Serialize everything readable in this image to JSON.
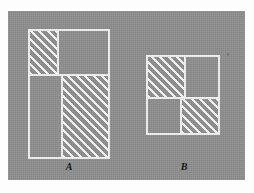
{
  "image": {
    "background_color": "#fdfdfd",
    "panel_color": "#8f8f8f",
    "line_color": "#f2f2f2",
    "hatch_color": "#ffffff",
    "label_color": "#111111"
  },
  "figures": [
    {
      "id": "A",
      "label": "A",
      "shape": "tall-rectangle-subdivided",
      "description": "Tall rectangle divided into four regions; upper-left and lower-right regions are hatched",
      "regions": [
        {
          "name": "upper-left",
          "hatched": true,
          "position": "top-left"
        },
        {
          "name": "upper-right",
          "hatched": false,
          "position": "top-right"
        },
        {
          "name": "lower-left",
          "hatched": false,
          "position": "bottom-left"
        },
        {
          "name": "lower-right",
          "hatched": true,
          "position": "bottom-right"
        }
      ]
    },
    {
      "id": "B",
      "label": "B",
      "shape": "square-quadrants",
      "description": "Square divided into four quadrants; upper-left and lower-right quadrants are hatched",
      "regions": [
        {
          "name": "upper-left",
          "hatched": true,
          "position": "top-left"
        },
        {
          "name": "upper-right",
          "hatched": false,
          "position": "top-right"
        },
        {
          "name": "lower-left",
          "hatched": false,
          "position": "bottom-left"
        },
        {
          "name": "lower-right",
          "hatched": true,
          "position": "bottom-right"
        }
      ]
    }
  ]
}
